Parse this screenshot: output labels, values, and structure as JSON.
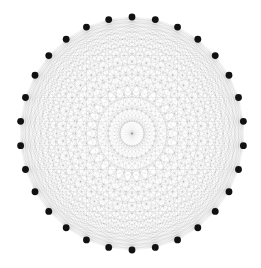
{
  "diagram": {
    "type": "complete-graph-circular-layout",
    "graph": "K30",
    "node_count": 30,
    "edge_count": 435,
    "layout": {
      "center_x": 132,
      "center_y": 133.5,
      "radius_x": 112,
      "radius_y": 116.5,
      "start_angle_deg": -90
    },
    "style": {
      "background": "#ffffff",
      "node_color": "#111111",
      "node_radius": 3.4,
      "edge_color": "#000000",
      "edge_opacity": 0.16,
      "edge_width": 0.35
    }
  }
}
